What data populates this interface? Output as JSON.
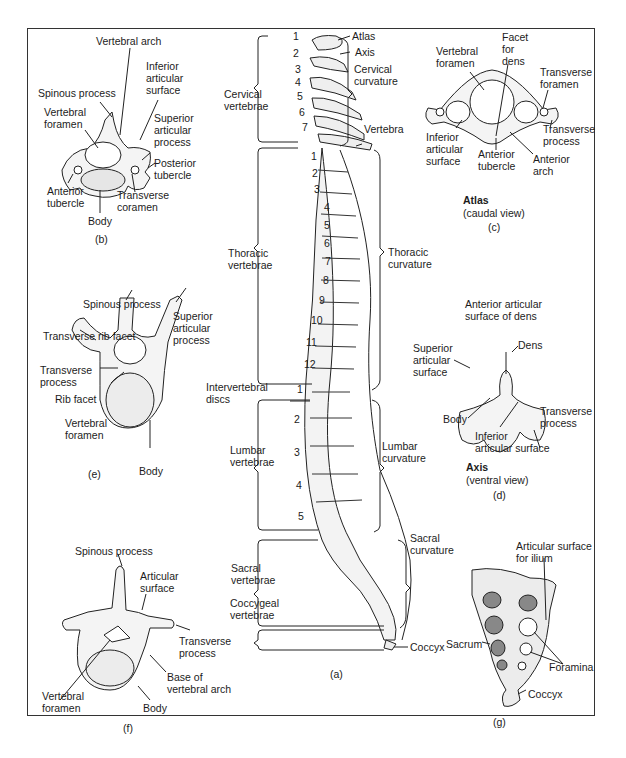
{
  "panels": {
    "a": {
      "caption": "(a)",
      "vertebra_groups": [
        {
          "name": "Cervical vertebrae",
          "numbers": [
            "1",
            "2",
            "3",
            "4",
            "5",
            "6",
            "7"
          ]
        },
        {
          "name": "Thoracic vertebrae",
          "numbers": [
            "1",
            "2",
            "3",
            "4",
            "5",
            "6",
            "7",
            "8",
            "9",
            "10",
            "11",
            "12"
          ]
        },
        {
          "name": "Lumbar vertebrae",
          "numbers": [
            "1",
            "2",
            "3",
            "4",
            "5"
          ]
        },
        {
          "name": "Sacral vertebrae",
          "numbers": []
        },
        {
          "name": "Coccygeal vertebrae",
          "numbers": []
        }
      ],
      "labels": {
        "cervical_vertebrae": "Cervical\nvertebrae",
        "thoracic_vertebrae": "Thoracic\nvertebrae",
        "lumbar_vertebrae": "Lumbar\nvertebrae",
        "sacral_vertebrae": "Sacral\nvertebrae",
        "coccygeal_vertebrae": "Coccygeal\nvertebrae",
        "intervertebral_discs": "Intervertebral\ndiscs",
        "atlas": "Atlas",
        "axis": "Axis",
        "cervical_curvature": "Cervical\ncurvature",
        "vertebra": "Vertebra",
        "thoracic_curvature": "Thoracic\ncurvature",
        "lumbar_curvature": "Lumbar\ncurvature",
        "sacral_curvature": "Sacral\ncurvature",
        "coccyx": "Coccyx"
      }
    },
    "b": {
      "caption": "(b)",
      "labels": {
        "vertebral_arch": "Vertebral arch",
        "inferior_articular_surface": "Inferior\narticular\nsurface",
        "spinous_process": "Spinous process",
        "vertebral_foramen": "Vertebral\nforamen",
        "superior_articular_process": "Superior\narticular\nprocess",
        "posterior_tubercle": "Posterior\ntubercle",
        "anterior_tubercle": "Anterior\ntubercle",
        "transverse_foramen": "Transverse\ncoramen",
        "body": "Body"
      }
    },
    "c": {
      "caption": "(c)",
      "title": "Atlas",
      "subtitle": "(caudal view)",
      "labels": {
        "vertebral_foramen": "Vertebral\nforamen",
        "facet_for_dens": "Facet\nfor\ndens",
        "transverse_foramen": "Transverse\nforamen",
        "transverse_process": "Transverse\nprocess",
        "inferior_articular_surface": "Inferior\narticular\nsurface",
        "anterior_tubercle": "Anterior\ntubercle",
        "anterior_arch": "Anterior\narch"
      }
    },
    "d": {
      "caption": "(d)",
      "title": "Axis",
      "subtitle": "(ventral view)",
      "labels": {
        "anterior_articular_surface_of_dens": "Anterior articular\nsurface of dens",
        "dens": "Dens",
        "superior_articular_surface": "Superior\narticular\nsurface",
        "body": "Body",
        "transverse_process": "Transverse\nprocess",
        "inferior_articular_surface": "Inferior\narticular surface"
      }
    },
    "e": {
      "caption": "(e)",
      "labels": {
        "spinous_process": "Spinous process",
        "superior_articular_process": "Superior\narticular\nprocess",
        "transverse_rib_facet": "Transverse rib facet",
        "transverse_process": "Transverse\nprocess",
        "rib_facet": "Rib facet",
        "vertebral_foramen": "Vertebral\nforamen",
        "body": "Body"
      }
    },
    "f": {
      "caption": "(f)",
      "labels": {
        "spinous_process": "Spinous process",
        "articular_surface": "Articular\nsurface",
        "transverse_process": "Transverse\nprocess",
        "base_of_vertebral_arch": "Base of\nvertebral arch",
        "vertebral_foramen": "Vertebral\nforamen",
        "body": "Body"
      }
    },
    "g": {
      "caption": "(g)",
      "labels": {
        "articular_surface_for_ilium": "Articular surface\nfor ilium",
        "sacrum": "Sacrum",
        "foramina": "Foramina",
        "coccyx": "Coccyx"
      }
    }
  }
}
